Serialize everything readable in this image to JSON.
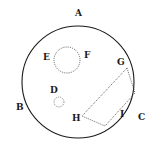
{
  "diagram": {
    "outer_circle": {
      "cx": 78,
      "cy": 82,
      "r": 56
    },
    "circle_ef": {
      "cx": 67,
      "cy": 60,
      "r": 13
    },
    "circle_d": {
      "cx": 59,
      "cy": 102,
      "r": 5
    },
    "polygon_points": "127,68 135,93 105,126 82,116",
    "labels": {
      "A": "A",
      "B": "B",
      "C": "C",
      "D": "D",
      "E": "E",
      "F": "F",
      "G": "G",
      "H": "H",
      "I": "I"
    },
    "colors": {
      "stroke": "#1a1a1a",
      "background": "#ffffff"
    }
  }
}
